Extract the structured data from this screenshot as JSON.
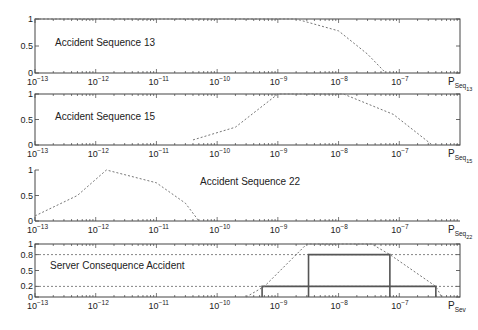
{
  "chart_data": [
    {
      "type": "line",
      "title": "Accident Sequence 13",
      "xlabel": "P_Seq_13",
      "xscale": "log",
      "xlim": [
        1e-13,
        1e-06
      ],
      "ylim": [
        0,
        1
      ],
      "yticks": [
        0,
        0.5,
        1
      ],
      "xticks": [
        "10^-13",
        "10^-12",
        "10^-11",
        "10^-10",
        "10^-9",
        "10^-8",
        "10^-7"
      ],
      "series": [
        {
          "name": "membership",
          "style": "dotted",
          "points": [
            [
              1e-13,
              1
            ],
            [
              2e-09,
              1
            ],
            [
              1e-08,
              0.78
            ],
            [
              3e-08,
              0.35
            ],
            [
              6e-08,
              0
            ]
          ]
        }
      ]
    },
    {
      "type": "line",
      "title": "Accident Sequence 15",
      "xlabel": "P_Seq_15",
      "xscale": "log",
      "xlim": [
        1e-13,
        1e-06
      ],
      "ylim": [
        0,
        1
      ],
      "yticks": [
        0,
        0.5,
        1
      ],
      "xticks": [
        "10^-13",
        "10^-12",
        "10^-11",
        "10^-10",
        "10^-9",
        "10^-8",
        "10^-7"
      ],
      "series": [
        {
          "name": "membership",
          "style": "dotted",
          "points": [
            [
              4e-11,
              0.1
            ],
            [
              2e-10,
              0.35
            ],
            [
              1e-09,
              1
            ],
            [
              1.2e-08,
              1
            ],
            [
              8e-08,
              0.6
            ],
            [
              3.5e-07,
              0
            ]
          ]
        }
      ]
    },
    {
      "type": "line",
      "title": "Accident Sequence 22",
      "xlabel": "P_Seq_22",
      "xscale": "log",
      "xlim": [
        1e-13,
        1e-06
      ],
      "ylim": [
        0,
        1
      ],
      "yticks": [
        0,
        0.5,
        1
      ],
      "xticks": [
        "10^-13",
        "10^-12",
        "10^-11",
        "10^-10",
        "10^-9",
        "10^-8",
        "10^-7"
      ],
      "series": [
        {
          "name": "membership",
          "style": "dotted",
          "points": [
            [
              1e-13,
              0.1
            ],
            [
              5e-13,
              0.5
            ],
            [
              1.5e-12,
              1
            ],
            [
              1e-11,
              0.75
            ],
            [
              3e-11,
              0.35
            ],
            [
              5e-11,
              0
            ]
          ]
        }
      ]
    },
    {
      "type": "line",
      "title": "Server Consequence Accident",
      "xlabel": "P_Sev",
      "xscale": "log",
      "xlim": [
        1e-13,
        1e-06
      ],
      "ylim": [
        0,
        1
      ],
      "yticks": [
        0,
        0.2,
        0.5,
        0.8,
        1
      ],
      "xticks": [
        "10^-13",
        "10^-12",
        "10^-11",
        "10^-10",
        "10^-9",
        "10^-8",
        "10^-7"
      ],
      "alpha_cuts": [
        {
          "level": 0.2,
          "lower": 5.5e-10,
          "upper": 4e-07
        },
        {
          "level": 0.8,
          "lower": 3.2e-09,
          "upper": 7e-08
        }
      ],
      "series": [
        {
          "name": "membership",
          "style": "dotted",
          "points": [
            [
              3e-10,
              0
            ],
            [
              6e-10,
              0.2
            ],
            [
              3e-09,
              1
            ],
            [
              3.5e-08,
              1
            ],
            [
              7e-08,
              0.8
            ],
            [
              4e-07,
              0.2
            ],
            [
              5e-07,
              0
            ]
          ]
        }
      ]
    }
  ],
  "panels": [
    {
      "title": "Accident Sequence 13",
      "xlabel_main": "P",
      "xlabel_sub": "Seq",
      "xlabel_subsub": "13",
      "yticks": [
        "0",
        "0.5",
        "1"
      ]
    },
    {
      "title": "Accident Sequence 15",
      "xlabel_main": "P",
      "xlabel_sub": "Seq",
      "xlabel_subsub": "15",
      "yticks": [
        "0",
        "0.5",
        "1"
      ]
    },
    {
      "title": "Accident Sequence 22",
      "xlabel_main": "P",
      "xlabel_sub": "Seq",
      "xlabel_subsub": "22",
      "yticks": [
        "0",
        "0.5",
        "1"
      ]
    },
    {
      "title": "Server Consequence Accident",
      "xlabel_main": "P",
      "xlabel_sub": "Sev",
      "xlabel_subsub": "",
      "yticks": [
        "0",
        "0.2",
        "0.5",
        "0.8",
        "1"
      ]
    }
  ],
  "xtick_base": "10",
  "xtick_exponents": [
    "−13",
    "−12",
    "−11",
    "−10",
    "−9",
    "−8",
    "−7"
  ]
}
